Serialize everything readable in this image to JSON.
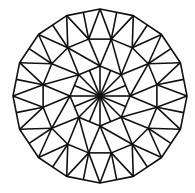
{
  "figure": {
    "center": [
      100,
      96
    ],
    "outer_sides": 16,
    "outer_radius": 87,
    "middle_ring_count": 16,
    "middle_radius": 58,
    "inner_ring_count": 8,
    "inner_radius": 30,
    "stroke_color": "#111111",
    "background_color": "#ffffff"
  }
}
